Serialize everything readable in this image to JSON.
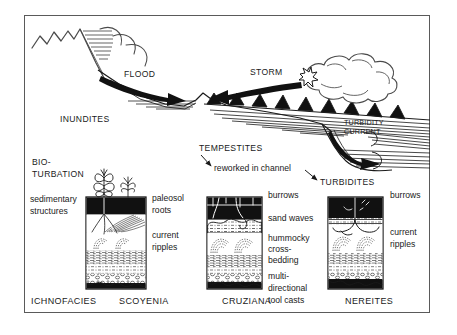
{
  "figure": {
    "border_color": "#5a5a5a",
    "ink_color": "#1a1a1a",
    "background": "#ffffff"
  },
  "scene": {
    "flood_label": "FLOOD",
    "storm_label": "STORM",
    "inundites_label": "INUNDITES",
    "tempestites_label": "TEMPESTITES",
    "tempestites_note": "reworked in channel",
    "turbidites_label": "TURBIDITES",
    "turbidity_current_line1": "TURBIDITY",
    "turbidity_current_line2": "CURRENT"
  },
  "left_annotations": {
    "biotubation_line1": "BIO-",
    "biotubation_line2": "TURBATION",
    "sedimentary_line1": "sedimentary",
    "sedimentary_line2": "structures"
  },
  "columns": [
    {
      "name": "scoyenia-column",
      "caption": "SCOYENIA",
      "labels": [
        {
          "name": "paleosol-label",
          "text": "paleosol"
        },
        {
          "name": "roots-label",
          "text": "roots"
        },
        {
          "name": "current-label",
          "text": "current"
        },
        {
          "name": "ripples-label",
          "text": "ripples"
        }
      ]
    },
    {
      "name": "cruziana-column",
      "caption": "CRUZIANA",
      "labels": [
        {
          "name": "burrows-label",
          "text": "burrows"
        },
        {
          "name": "sand-waves-label",
          "text": "sand waves"
        },
        {
          "name": "hummocky-label",
          "text": "hummocky"
        },
        {
          "name": "cross-label",
          "text": "cross-"
        },
        {
          "name": "bedding-label",
          "text": "bedding"
        },
        {
          "name": "multi-label",
          "text": "multi-"
        },
        {
          "name": "directional-label",
          "text": "directional"
        },
        {
          "name": "tool-casts-label",
          "text": "tool casts"
        }
      ]
    },
    {
      "name": "nereites-column",
      "caption": "NEREITES",
      "labels": [
        {
          "name": "burrows-label",
          "text": "burrows"
        },
        {
          "name": "current-label",
          "text": "current"
        },
        {
          "name": "ripples-label",
          "text": "ripples"
        }
      ]
    }
  ],
  "footer": {
    "ichnofacies_label": "ICHNOFACIES",
    "scoyenia_label": "SCOYENIA",
    "cruziana_label": "CRUZIANA",
    "nereites_label": "NEREITES"
  }
}
